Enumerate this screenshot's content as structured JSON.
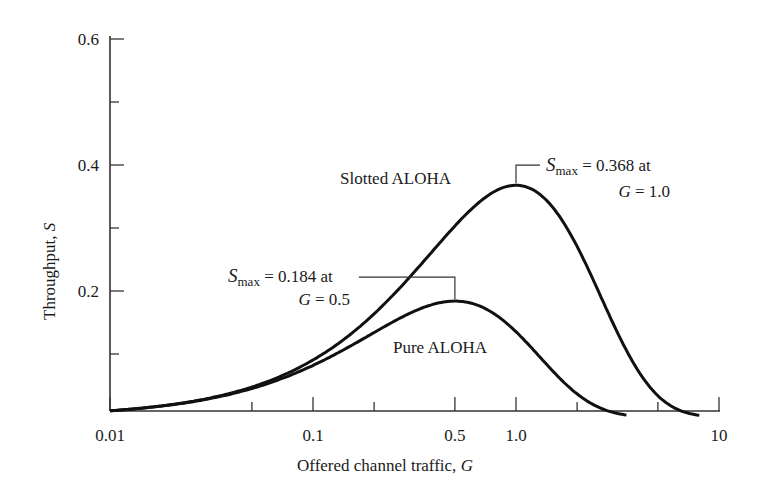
{
  "chart_data": {
    "type": "line",
    "title": "",
    "xlabel": "Offered channel traffic, G",
    "xlabel_parts": {
      "text": "Offered channel traffic, ",
      "var": "G"
    },
    "ylabel": "Throughput, S",
    "ylabel_parts": {
      "text": "Throughput, ",
      "var": "S"
    },
    "x_scale": "log",
    "xlim": [
      0.01,
      10
    ],
    "ylim": [
      0,
      0.6
    ],
    "grid": false,
    "legend": "none (inline curve labels)",
    "x_ticks": [
      {
        "value": 0.01,
        "label": "0.01",
        "major": true
      },
      {
        "value": 0.05,
        "label": "",
        "major": false
      },
      {
        "value": 0.1,
        "label": "0.1",
        "major": true
      },
      {
        "value": 0.2,
        "label": "",
        "major": false
      },
      {
        "value": 0.5,
        "label": "0.5",
        "major": true
      },
      {
        "value": 1.0,
        "label": "1.0",
        "major": true
      },
      {
        "value": 2,
        "label": "",
        "major": false
      },
      {
        "value": 5,
        "label": "",
        "major": false
      },
      {
        "value": 10,
        "label": "10",
        "major": true
      }
    ],
    "y_ticks": [
      {
        "value": 0.1,
        "label": "",
        "major": false
      },
      {
        "value": 0.2,
        "label": "0.2",
        "major": true
      },
      {
        "value": 0.3,
        "label": "",
        "major": false
      },
      {
        "value": 0.4,
        "label": "0.4",
        "major": true
      },
      {
        "value": 0.5,
        "label": "",
        "major": false
      },
      {
        "value": 0.6,
        "label": "0.6",
        "major": true
      }
    ],
    "series": [
      {
        "name": "Slotted ALOHA",
        "formula": "S = G e^{-G}",
        "x": [
          0.01,
          0.02,
          0.05,
          0.1,
          0.2,
          0.3,
          0.5,
          0.7,
          1.0,
          1.5,
          2,
          3,
          4,
          5,
          6,
          7,
          8
        ],
        "values": [
          0.0099,
          0.0196,
          0.0476,
          0.0905,
          0.1637,
          0.2222,
          0.3033,
          0.3476,
          0.3679,
          0.3347,
          0.2707,
          0.1494,
          0.0733,
          0.0337,
          0.0149,
          0.0064,
          0.0027
        ],
        "max": {
          "S": 0.368,
          "G": 1.0
        }
      },
      {
        "name": "Pure ALOHA",
        "formula": "S = G e^{-2G}",
        "x": [
          0.01,
          0.02,
          0.05,
          0.1,
          0.2,
          0.3,
          0.4,
          0.5,
          0.7,
          1.0,
          1.5,
          2,
          2.5,
          3,
          3.5
        ],
        "values": [
          0.0098,
          0.0192,
          0.0452,
          0.0819,
          0.1341,
          0.1646,
          0.1797,
          0.1839,
          0.1726,
          0.1353,
          0.0747,
          0.0366,
          0.0168,
          0.0074,
          0.0032
        ],
        "max": {
          "S": 0.184,
          "G": 0.5
        }
      }
    ],
    "annotations": [
      {
        "target": "Slotted ALOHA peak",
        "line1_var": "S",
        "line1_sub": "max",
        "line1_rest": " = 0.368 at",
        "line2_var": "G",
        "line2_rest": " = 1.0"
      },
      {
        "target": "Pure ALOHA peak",
        "line1_var": "S",
        "line1_sub": "max",
        "line1_rest": " = 0.184 at",
        "line2_var": "G",
        "line2_rest": " = 0.5"
      }
    ],
    "curve_labels": [
      "Slotted ALOHA",
      "Pure ALOHA"
    ]
  }
}
